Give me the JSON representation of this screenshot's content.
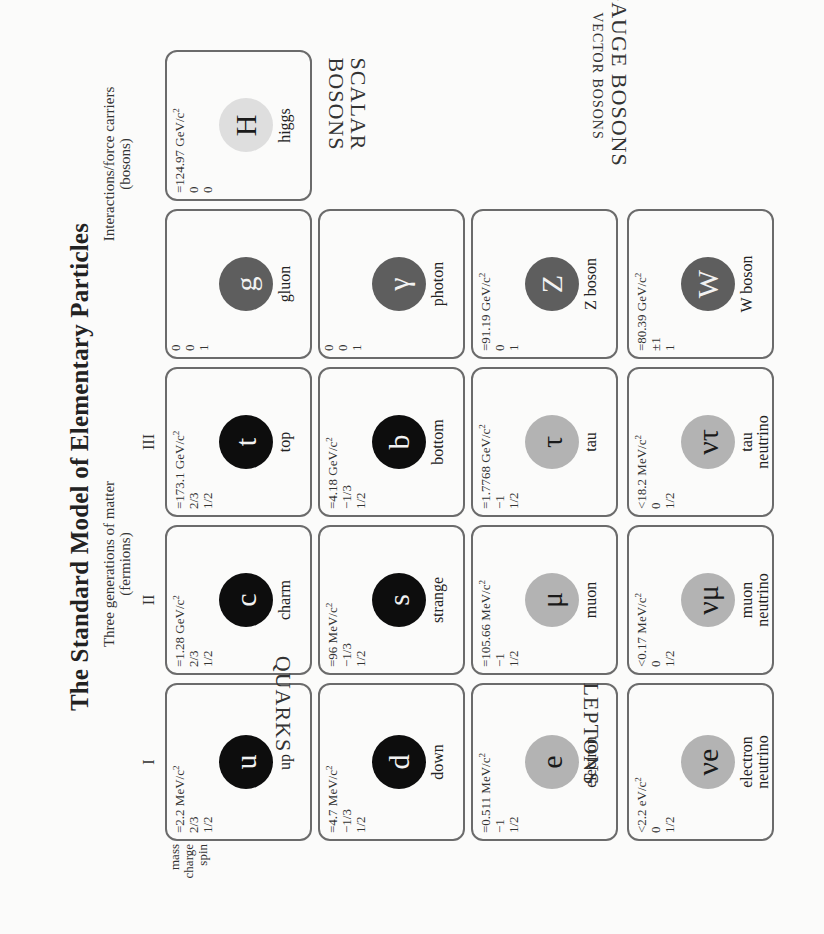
{
  "title": "The Standard Model of Elementary Particles",
  "fermions_header": {
    "line1": "Three generations of matter",
    "line2": "(fermions)"
  },
  "bosons_header": {
    "line1": "Interactions/force carriers",
    "line2": "(bosons)"
  },
  "generations": [
    "I",
    "II",
    "III"
  ],
  "legend": {
    "mass": "mass",
    "charge": "charge",
    "spin": "spin"
  },
  "sections": {
    "quarks": "QUARKS",
    "leptons": "LEPTONS",
    "gauge_bosons": "GAUGE BOSONS",
    "vector_bosons": "VECTOR BOSONS",
    "scalar_bosons_1": "SCALAR",
    "scalar_bosons_2": "BOSONS"
  },
  "colors": {
    "quark": "#0d0d0d",
    "gauge": "#5e5e5e",
    "lepton": "#b3b3b3",
    "higgs": "#dedede",
    "border": "#6b6b6b",
    "background": "#fbfbfa"
  },
  "particles": {
    "up": {
      "mass": "=2.2 MeV/c",
      "charge": "2/3",
      "spin": "1/2",
      "symbol": "u",
      "name": "up"
    },
    "charm": {
      "mass": "=1.28 GeV/c",
      "charge": "2/3",
      "spin": "1/2",
      "symbol": "c",
      "name": "charm"
    },
    "top": {
      "mass": "=173.1 GeV/c",
      "charge": "2/3",
      "spin": "1/2",
      "symbol": "t",
      "name": "top"
    },
    "down": {
      "mass": "=4.7 MeV/c",
      "charge": "−1/3",
      "spin": "1/2",
      "symbol": "d",
      "name": "down"
    },
    "strange": {
      "mass": "=96 MeV/c",
      "charge": "−1/3",
      "spin": "1/2",
      "symbol": "s",
      "name": "strange"
    },
    "bottom": {
      "mass": "=4.18 GeV/c",
      "charge": "−1/3",
      "spin": "1/2",
      "symbol": "b",
      "name": "bottom"
    },
    "electron": {
      "mass": "=0.511 MeV/c",
      "charge": "−1",
      "spin": "1/2",
      "symbol": "e",
      "name": "electron"
    },
    "muon": {
      "mass": "=105.66 MeV/c",
      "charge": "−1",
      "spin": "1/2",
      "symbol": "μ",
      "name": "muon"
    },
    "tau": {
      "mass": "=1.7768 GeV/c",
      "charge": "−1",
      "spin": "1/2",
      "symbol": "τ",
      "name": "tau"
    },
    "nu_e": {
      "mass": "<2.2 eV/c",
      "charge": "0",
      "spin": "1/2",
      "symbol": "νe",
      "name1": "electron",
      "name2": "neutrino"
    },
    "nu_mu": {
      "mass": "<0.17 MeV/c",
      "charge": "0",
      "spin": "1/2",
      "symbol": "νμ",
      "name1": "muon",
      "name2": "neutrino"
    },
    "nu_tau": {
      "mass": "<18.2 MeV/c",
      "charge": "0",
      "spin": "1/2",
      "symbol": "ντ",
      "name1": "tau",
      "name2": "neutrino"
    },
    "gluon": {
      "mass": "0",
      "charge": "0",
      "spin": "1",
      "symbol": "g",
      "name": "gluon"
    },
    "photon": {
      "mass": "0",
      "charge": "0",
      "spin": "1",
      "symbol": "γ",
      "name": "photon"
    },
    "z": {
      "mass": "=91.19 GeV/c",
      "charge": "0",
      "spin": "1",
      "symbol": "Z",
      "name": "Z boson"
    },
    "w": {
      "mass": "=80.39 GeV/c",
      "charge": "±1",
      "spin": "1",
      "symbol": "W",
      "name": "W boson"
    },
    "higgs": {
      "mass": "=124.97 GeV/c",
      "charge": "0",
      "spin": "0",
      "symbol": "H",
      "name": "higgs"
    }
  },
  "mass_unit_exponent": "2"
}
